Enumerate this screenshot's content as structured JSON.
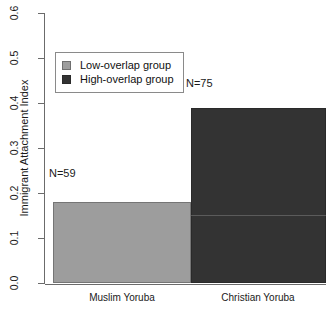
{
  "chart_data": {
    "type": "bar",
    "title": "",
    "xlabel": "",
    "ylabel": "Immigrant Attachment Index",
    "categories": [
      "Muslim Yoruba",
      "Christian Yoruba"
    ],
    "values": [
      0.18,
      0.39
    ],
    "ylim": [
      0.0,
      0.6
    ],
    "y_ticks": [
      "0.0",
      "0.1",
      "0.2",
      "0.3",
      "0.4",
      "0.5",
      "0.6"
    ],
    "y_tick_values": [
      0.0,
      0.1,
      0.2,
      0.3,
      0.4,
      0.5,
      0.6
    ],
    "grid": false,
    "legend_position": "top-left",
    "series": [
      {
        "name": "Low-overlap group",
        "category": "Muslim Yoruba",
        "value": 0.18,
        "n_label": "N=59",
        "color": "#9d9d9d"
      },
      {
        "name": "High-overlap group",
        "category": "Christian Yoruba",
        "value": 0.39,
        "n_label": "N=75",
        "color": "#333333"
      }
    ],
    "annotations": [
      "N=59",
      "N=75"
    ]
  },
  "axes": {
    "y_title": "Immigrant Attachment Index",
    "y_ticks": [
      "0.0",
      "0.1",
      "0.2",
      "0.3",
      "0.4",
      "0.5",
      "0.6"
    ],
    "x_ticks": [
      "Muslim Yoruba",
      "Christian Yoruba"
    ]
  },
  "legend": {
    "items": [
      {
        "label": "Low-overlap group",
        "color": "#9d9d9d"
      },
      {
        "label": "High-overlap group",
        "color": "#333333"
      }
    ]
  },
  "annotations": {
    "n_low": "N=59",
    "n_high": "N=75"
  }
}
